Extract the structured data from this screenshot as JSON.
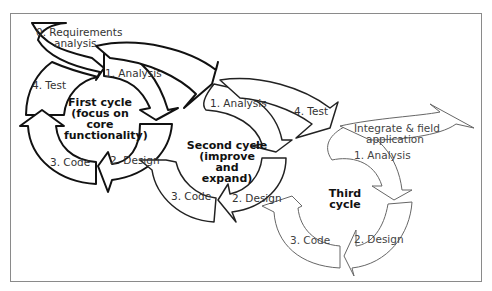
{
  "diagram": {
    "type": "spiral-iterative-lifecycle",
    "stroke_colors": {
      "first_cycle": "#111111",
      "second_cycle": "#222222",
      "third_cycle": "#666666"
    },
    "start": {
      "label_line1": "0. Requirements",
      "label_line2": "analysis"
    },
    "first_cycle": {
      "center_lines": [
        "First cycle",
        "(focus on",
        "core",
        "functionality)"
      ],
      "steps": {
        "analysis": "1. Analysis",
        "design": "2. Design",
        "code": "3. Code",
        "test": "4. Test"
      }
    },
    "second_cycle": {
      "center_lines": [
        "Second cycle",
        "(improve",
        "and",
        "expand)"
      ],
      "steps": {
        "analysis": "1. Analysis",
        "design": "2. Design",
        "code": "3. Code",
        "test": "4. Test"
      }
    },
    "third_cycle": {
      "center_lines": [
        "Third",
        "cycle"
      ],
      "steps": {
        "analysis": "1. Analysis",
        "design": "2. Design",
        "code": "3. Code"
      }
    },
    "end": {
      "label_line1": "Integrate & field",
      "label_line2": "application"
    }
  }
}
